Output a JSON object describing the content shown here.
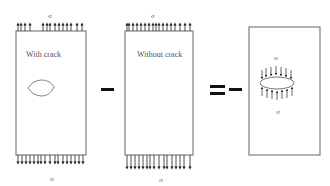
{
  "panels": [
    {
      "id": "with-crack",
      "label": "With crack",
      "stress_top": "σ",
      "stress_bottom": "σ"
    },
    {
      "id": "without-crack",
      "label": "Without crack",
      "stress_top": "σ",
      "stress_bottom": "σ"
    },
    {
      "id": "crack-faces-loaded",
      "label": "",
      "stress_top": "σ",
      "stress_bottom": "σ"
    }
  ],
  "operators": {
    "minus": "−",
    "equals_minus": "= −"
  },
  "colors": {
    "line": "#666666",
    "arrow": "#222222",
    "text": "#555555",
    "operator": "#111111"
  }
}
